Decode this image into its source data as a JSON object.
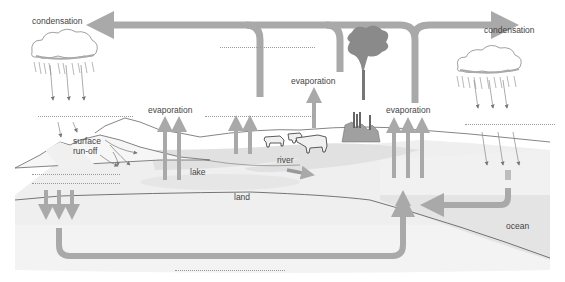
{
  "diagram": {
    "labels": {
      "condensation_left": "condensation",
      "condensation_right": "condensation",
      "evaporation_lake": "evaporation",
      "evaporation_center": "evaporation",
      "evaporation_ocean": "evaporation",
      "surface_runoff_1": "surface",
      "surface_runoff_2": "run-off",
      "lake": "lake",
      "river": "river",
      "land": "land",
      "ocean": "ocean"
    },
    "blanks": [
      {
        "id": "blank-top-center",
        "x": 220,
        "y": 47,
        "w": 95
      },
      {
        "id": "blank-above-lake",
        "x": 205,
        "y": 116,
        "w": 110
      },
      {
        "id": "blank-left-precip",
        "x": 38,
        "y": 116,
        "w": 95
      },
      {
        "id": "blank-left-infiltration-1",
        "x": 32,
        "y": 174,
        "w": 88
      },
      {
        "id": "blank-left-infiltration-2",
        "x": 32,
        "y": 183,
        "w": 88
      },
      {
        "id": "blank-right-precip",
        "x": 465,
        "y": 124,
        "w": 90
      },
      {
        "id": "blank-bottom",
        "x": 175,
        "y": 270,
        "w": 110
      }
    ],
    "colors": {
      "arrow": "#a9a9a9",
      "land_fill": "#eeeeee",
      "ground_fill": "#e6e6e6",
      "water_fill": "#dedede",
      "outline": "#666666",
      "text": "#444444"
    }
  }
}
